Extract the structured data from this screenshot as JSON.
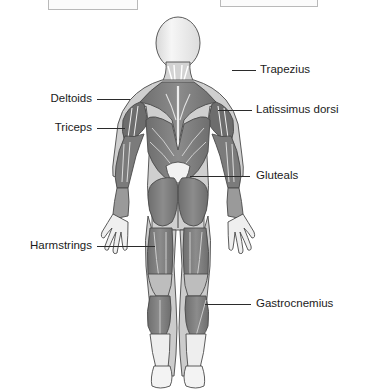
{
  "page": {
    "background_color": "#ffffff",
    "width": 372,
    "height": 392
  },
  "answer_boxes": [
    {
      "name": "answer-box-left",
      "text": "",
      "note": "empty input box clipped by top edge"
    },
    {
      "name": "answer-box-right",
      "text": "your back",
      "note": "text clipped by top edge, only descenders visible"
    }
  ],
  "diagram": {
    "title": "",
    "view": "posterior",
    "colors": {
      "muscle_mid": "#808080",
      "muscle_dark": "#5e5e5e",
      "muscle_light": "#c9c9c9",
      "skin_light": "#efefef",
      "outline": "#4a4a4a",
      "leader_line": "#2b2b2b",
      "label_text": "#1b1b1b"
    },
    "labels": {
      "trapezius": "Trapezius",
      "latissimus_dorsi": "Latissimus dorsi",
      "gluteals": "Gluteals",
      "gastrocnemius": "Gastrocnemius",
      "deltoids": "Deltoids",
      "triceps": "Triceps",
      "harmstrings": "Harmstrings"
    }
  }
}
